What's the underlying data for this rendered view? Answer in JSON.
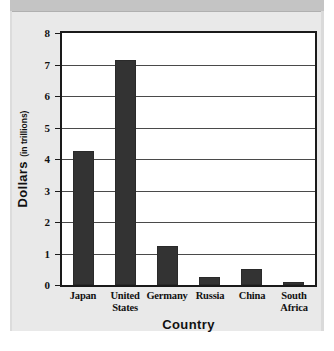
{
  "chart_data": {
    "type": "bar",
    "title": "",
    "xlabel": "Country",
    "ylabel": "Dollars",
    "ylabel_unit": "(in trillions)",
    "categories": [
      "Japan",
      "United States",
      "Germany",
      "Russia",
      "China",
      "South Africa"
    ],
    "values": [
      4.25,
      7.15,
      1.25,
      0.25,
      0.5,
      0.1
    ],
    "ylim": [
      0,
      8
    ],
    "ytick_labels": [
      "0",
      "1",
      "2",
      "3",
      "4",
      "5",
      "6",
      "7",
      "8"
    ],
    "ytick_values": [
      0,
      1,
      2,
      3,
      4,
      5,
      6,
      7,
      8
    ],
    "grid": true,
    "legend": "none",
    "bar_color": "#333333",
    "frame_color": "#1a1a1a",
    "gridline_color": "#4a4a4a",
    "panel_background": "#e9e9e9",
    "plot_background": "#ffffff"
  }
}
